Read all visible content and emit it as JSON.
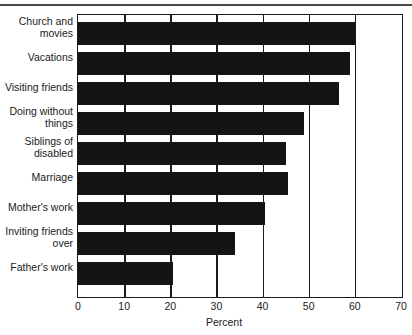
{
  "chart_data": {
    "type": "bar",
    "orientation": "horizontal",
    "title": "",
    "xlabel": "Percent",
    "ylabel": "",
    "xlim": [
      0,
      70
    ],
    "xticks": [
      0,
      10,
      20,
      30,
      40,
      50,
      60,
      70
    ],
    "grid": true,
    "grid_axis": "x",
    "legend": null,
    "bar_color": "#141414",
    "axis_color": "#1a1a1a",
    "background": "#ffffff",
    "categories": [
      "Church and movies",
      "Vacations",
      "Visiting friends",
      "Doing without things",
      "Siblings of disabled",
      "Marriage",
      "Mother's work",
      "Inviting friends over",
      "Father's work"
    ],
    "values": [
      60,
      59,
      56.5,
      49,
      45,
      45.5,
      40.5,
      34,
      20.5
    ],
    "points": [
      {
        "label_line1": "Church and",
        "label_line2": "movies",
        "value": 60
      },
      {
        "label_line1": "Vacations",
        "label_line2": "",
        "value": 59
      },
      {
        "label_line1": "Visiting friends",
        "label_line2": "",
        "value": 56.5
      },
      {
        "label_line1": "Doing without",
        "label_line2": "things",
        "value": 49
      },
      {
        "label_line1": "Siblings of",
        "label_line2": "disabled",
        "value": 45
      },
      {
        "label_line1": "Marriage",
        "label_line2": "",
        "value": 45.5
      },
      {
        "label_line1": "Mother's work",
        "label_line2": "",
        "value": 40.5
      },
      {
        "label_line1": "Inviting friends",
        "label_line2": "over",
        "value": 34
      },
      {
        "label_line1": "Father's work",
        "label_line2": "",
        "value": 20.5
      }
    ]
  },
  "axis": {
    "tick_labels": [
      "0",
      "10",
      "20",
      "30",
      "40",
      "50",
      "60",
      "70"
    ],
    "title": "Percent"
  },
  "categories": {
    "c0_l1": "Church and",
    "c0_l2": "movies",
    "c1_l1": "Vacations",
    "c1_l2": "",
    "c2_l1": "Visiting friends",
    "c2_l2": "",
    "c3_l1": "Doing without",
    "c3_l2": "things",
    "c4_l1": "Siblings of",
    "c4_l2": "disabled",
    "c5_l1": "Marriage",
    "c5_l2": "",
    "c6_l1": "Mother's work",
    "c6_l2": "",
    "c7_l1": "Inviting friends",
    "c7_l2": "over",
    "c8_l1": "Father's work",
    "c8_l2": ""
  }
}
